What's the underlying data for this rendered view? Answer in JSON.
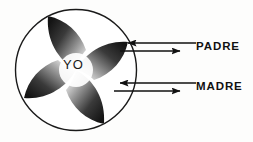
{
  "diagram": {
    "center_label": "YO",
    "labels": [
      {
        "id": "padre",
        "text": "PADRE"
      },
      {
        "id": "madre",
        "text": "MADRE"
      }
    ],
    "colors": {
      "background": "#fdfdfc",
      "outline": "#1a1a1a",
      "blade_dark": "#1e1e1e",
      "blade_mid": "#6a6a6a",
      "blade_light": "#e8e8e8",
      "text": "#111111"
    },
    "shape": {
      "kind": "pinwheel",
      "blade_count": 4,
      "circle_center_x": 76,
      "circle_center_y": 70,
      "circle_radius": 61
    },
    "arrows": [
      {
        "id": "padre-inbound",
        "direction": "left",
        "from_label": "PADRE",
        "to": "YO",
        "y": 43
      },
      {
        "id": "padre-outbound",
        "direction": "right",
        "from": "YO",
        "to_label": "PADRE",
        "y": 51
      },
      {
        "id": "madre-inbound",
        "direction": "left",
        "from_label": "MADRE",
        "to": "YO",
        "y": 83
      },
      {
        "id": "madre-outbound",
        "direction": "right",
        "from": "YO",
        "to_label": "MADRE",
        "y": 91
      }
    ]
  }
}
